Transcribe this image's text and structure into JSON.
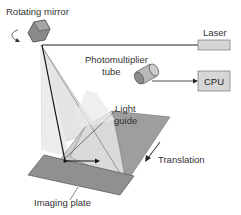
{
  "diagram": {
    "labels": {
      "rotating_mirror": "Rotating mirror",
      "laser": "Laser",
      "photomultiplier_line1": "Photomultiplier",
      "photomultiplier_line2": "tube",
      "cpu": "CPU",
      "light_guide_line1": "Light",
      "light_guide_line2": "guide",
      "translation": "Translation",
      "imaging_plate": "Imaging plate"
    },
    "colors": {
      "mirror": "#8a8a8a",
      "laser_box": "#d6d6d6",
      "cpu_box": "#d6d6d6",
      "scan_fan": "#e2e2e2",
      "light_guide": "#d0d0d0",
      "light_guide_dark": "#9a9a9a",
      "imaging_plate": "#8f8f8f",
      "lines": "#222222"
    }
  }
}
